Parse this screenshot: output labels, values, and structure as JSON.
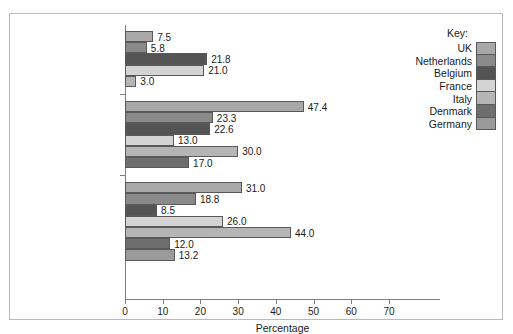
{
  "chart_data": {
    "type": "bar",
    "orientation": "horizontal",
    "title": "",
    "xlabel": "Percentage",
    "ylabel": "",
    "xlim": [
      0,
      70
    ],
    "xticks": [
      0,
      10,
      20,
      30,
      40,
      50,
      60,
      70
    ],
    "grid": false,
    "legend_position": "right",
    "legend_title": "Key:",
    "categories": [
      "Coupon holders",
      "Special displays",
      "Special signs"
    ],
    "series": [
      {
        "name": "UK",
        "color": "#a8a8a8",
        "values": [
          7.5,
          47.4,
          31.0
        ]
      },
      {
        "name": "Netherlands",
        "color": "#8a8a8a",
        "values": [
          5.8,
          23.3,
          18.8
        ]
      },
      {
        "name": "Belgium",
        "color": "#545454",
        "values": [
          21.8,
          22.6,
          8.5
        ]
      },
      {
        "name": "France",
        "color": "#d4d4d4",
        "values": [
          21.0,
          13.0,
          26.0
        ]
      },
      {
        "name": "Italy",
        "color": "#b5b5b5",
        "values": [
          3.0,
          30.0,
          44.0
        ]
      },
      {
        "name": "Denmark",
        "color": "#6e6e6e",
        "values": [
          null,
          17.0,
          12.0
        ]
      },
      {
        "name": "Germany",
        "color": "#9a9a9a",
        "values": [
          null,
          null,
          13.2
        ]
      }
    ],
    "bars": [
      {
        "category": "Coupon holders",
        "series": "UK",
        "value": 7.5,
        "label": "7.5"
      },
      {
        "category": "Coupon holders",
        "series": "Netherlands",
        "value": 5.8,
        "label": "5.8"
      },
      {
        "category": "Coupon holders",
        "series": "Belgium",
        "value": 21.8,
        "label": "21.8"
      },
      {
        "category": "Coupon holders",
        "series": "France",
        "value": 21.0,
        "label": "21.0"
      },
      {
        "category": "Coupon holders",
        "series": "Italy",
        "value": 3.0,
        "label": "3.0"
      },
      {
        "category": "Special displays",
        "series": "UK",
        "value": 47.4,
        "label": "47.4"
      },
      {
        "category": "Special displays",
        "series": "Netherlands",
        "value": 23.3,
        "label": "23.3"
      },
      {
        "category": "Special displays",
        "series": "Belgium",
        "value": 22.6,
        "label": "22.6"
      },
      {
        "category": "Special displays",
        "series": "France",
        "value": 13.0,
        "label": "13.0"
      },
      {
        "category": "Special displays",
        "series": "Italy",
        "value": 30.0,
        "label": "30.0"
      },
      {
        "category": "Special displays",
        "series": "Denmark",
        "value": 17.0,
        "label": "17.0"
      },
      {
        "category": "Special signs",
        "series": "UK",
        "value": 31.0,
        "label": "31.0"
      },
      {
        "category": "Special signs",
        "series": "Netherlands",
        "value": 18.8,
        "label": "18.8"
      },
      {
        "category": "Special signs",
        "series": "Belgium",
        "value": 8.5,
        "label": "8.5"
      },
      {
        "category": "Special signs",
        "series": "France",
        "value": 26.0,
        "label": "26.0"
      },
      {
        "category": "Special signs",
        "series": "Italy",
        "value": 44.0,
        "label": "44.0"
      },
      {
        "category": "Special signs",
        "series": "Denmark",
        "value": 12.0,
        "label": "12.0"
      },
      {
        "category": "Special signs",
        "series": "Germany",
        "value": 13.2,
        "label": "13.2"
      }
    ]
  },
  "axis": {
    "x_title": "Percentage",
    "x_tick_labels": [
      "0",
      "10",
      "20",
      "30",
      "40",
      "50",
      "60",
      "70"
    ]
  },
  "categories": {
    "labels": [
      "Coupon holders",
      "Special displays",
      "Special signs"
    ]
  },
  "legend": {
    "title": "Key:",
    "items": [
      {
        "label": "UK",
        "color": "#a8a8a8"
      },
      {
        "label": "Netherlands",
        "color": "#8a8a8a"
      },
      {
        "label": "Belgium",
        "color": "#545454"
      },
      {
        "label": "France",
        "color": "#d4d4d4"
      },
      {
        "label": "Italy",
        "color": "#b5b5b5"
      },
      {
        "label": "Denmark",
        "color": "#6e6e6e"
      },
      {
        "label": "Germany",
        "color": "#9a9a9a"
      }
    ]
  }
}
